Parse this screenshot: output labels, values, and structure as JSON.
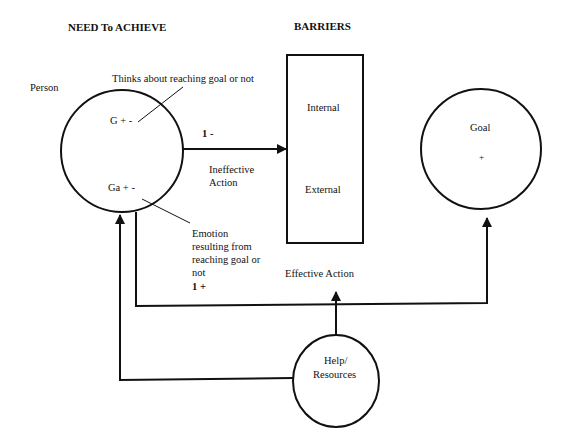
{
  "headings": {
    "need": "NEED To ACHIEVE",
    "barriers": "BARRIERS"
  },
  "person": {
    "label": "Person",
    "g": "G + -",
    "ga": "Ga + -",
    "thinks": "Thinks about reaching goal or not",
    "emotion": [
      "Emotion",
      "resulting from",
      "reaching goal or",
      "not"
    ]
  },
  "barrier_box": {
    "internal": "Internal",
    "external": "External"
  },
  "goal": {
    "label": "Goal",
    "sign": "+"
  },
  "help": {
    "line1": "Help/",
    "line2": "Resources"
  },
  "arrows": {
    "ineffective_sign": "1 -",
    "ineffective_label_1": "Ineffective",
    "ineffective_label_2": "Action",
    "effective_sign": "1 +",
    "effective_label": "Effective Action"
  },
  "colors": {
    "stroke": "#111111",
    "background": "#ffffff"
  }
}
